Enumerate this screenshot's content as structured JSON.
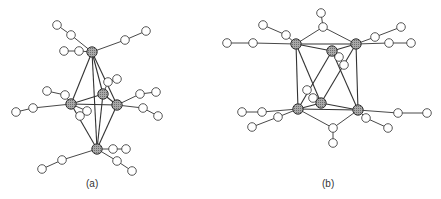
{
  "figure": {
    "panels": [
      {
        "id": "a",
        "label": "(a)",
        "label_pos": [
          92,
          185
        ],
        "metals": [
          [
            92,
            52
          ],
          [
            103,
            94
          ],
          [
            71,
            104
          ],
          [
            117,
            105
          ],
          [
            97,
            149
          ]
        ],
        "metal_bonds": [
          [
            0,
            1
          ],
          [
            0,
            2
          ],
          [
            0,
            3
          ],
          [
            1,
            2
          ],
          [
            1,
            3
          ],
          [
            2,
            3
          ],
          [
            4,
            1
          ],
          [
            4,
            2
          ],
          [
            4,
            3
          ],
          [
            0,
            4
          ]
        ],
        "ligands": [
          {
            "m": 0,
            "atoms": [
              [
                71,
                35
              ],
              [
                57,
                25
              ]
            ]
          },
          {
            "m": 0,
            "atoms": [
              [
                79,
                51
              ],
              [
                64,
                51
              ]
            ]
          },
          {
            "m": 0,
            "atoms": [
              [
                125,
                40
              ],
              [
                146,
                31
              ]
            ]
          },
          {
            "m": 1,
            "atoms": [
              [
                108,
                82
              ],
              [
                117,
                79
              ]
            ]
          },
          {
            "m": 2,
            "atoms": [
              [
                65,
                95
              ],
              [
                47,
                91
              ]
            ]
          },
          {
            "m": 2,
            "atoms": [
              [
                33,
                108
              ],
              [
                16,
                112
              ]
            ]
          },
          {
            "m": 2,
            "atoms": [
              [
                87,
                111
              ],
              [
                80,
                116
              ]
            ]
          },
          {
            "m": 3,
            "atoms": [
              [
                140,
                94
              ],
              [
                156,
                92
              ]
            ]
          },
          {
            "m": 3,
            "atoms": [
              [
                143,
                108
              ],
              [
                158,
                116
              ]
            ]
          },
          {
            "m": 4,
            "atoms": [
              [
                113,
                149
              ],
              [
                126,
                149
              ]
            ]
          },
          {
            "m": 4,
            "atoms": [
              [
                117,
                161
              ],
              [
                132,
                171
              ]
            ]
          },
          {
            "m": 4,
            "atoms": [
              [
                62,
                160
              ],
              [
                42,
                169
              ]
            ]
          }
        ]
      },
      {
        "id": "b",
        "label": "(b)",
        "label_pos": [
          328,
          185
        ],
        "metals": [
          [
            296,
            44
          ],
          [
            332,
            51
          ],
          [
            356,
            44
          ],
          [
            298,
            109
          ],
          [
            321,
            103
          ],
          [
            358,
            110
          ]
        ],
        "metal_bonds": [
          [
            0,
            1
          ],
          [
            1,
            2
          ],
          [
            0,
            2
          ],
          [
            3,
            4
          ],
          [
            4,
            5
          ],
          [
            3,
            5
          ],
          [
            0,
            3
          ],
          [
            2,
            5
          ],
          [
            0,
            4
          ],
          [
            1,
            3
          ],
          [
            1,
            5
          ],
          [
            2,
            4
          ]
        ],
        "ligands": [
          {
            "m": 0,
            "atoms": [
              [
                286,
                35
              ],
              [
                263,
                25
              ]
            ]
          },
          {
            "m": 0,
            "atoms": [
              [
                253,
                43
              ],
              [
                227,
                43
              ]
            ]
          },
          {
            "m": 2,
            "atoms": [
              [
                375,
                37
              ],
              [
                401,
                27
              ]
            ]
          },
          {
            "m": 2,
            "atoms": [
              [
                389,
                43
              ],
              [
                411,
                43
              ]
            ]
          },
          {
            "m": 1,
            "atoms": [
              [
                339,
                57
              ],
              [
                344,
                65
              ]
            ]
          },
          {
            "m": 4,
            "atoms": [
              [
                313,
                98
              ],
              [
                307,
                90
              ]
            ]
          },
          {
            "m": 3,
            "atoms": [
              [
                262,
                112
              ],
              [
                242,
                112
              ]
            ]
          },
          {
            "m": 3,
            "atoms": [
              [
                278,
                117
              ],
              [
                252,
                127
              ]
            ]
          },
          {
            "m": 5,
            "atoms": [
              [
                398,
                113
              ],
              [
                427,
                113
              ]
            ]
          },
          {
            "m": 5,
            "atoms": [
              [
                366,
                118
              ],
              [
                388,
                128
              ]
            ]
          }
        ],
        "bridges": [
          {
            "between": [
              0,
              2
            ],
            "atoms": [
              [
                323,
                27
              ],
              [
                321,
                13
              ]
            ]
          },
          {
            "between": [
              3,
              5
            ],
            "atoms": [
              [
                333,
                128
              ],
              [
                333,
                143
              ]
            ]
          }
        ]
      }
    ],
    "colors": {
      "metal_fill": "#9a9a9a",
      "metal_stroke": "#333333",
      "ligand_fill": "#ffffff",
      "ligand_stroke": "#444444",
      "bond": "#333333"
    }
  }
}
